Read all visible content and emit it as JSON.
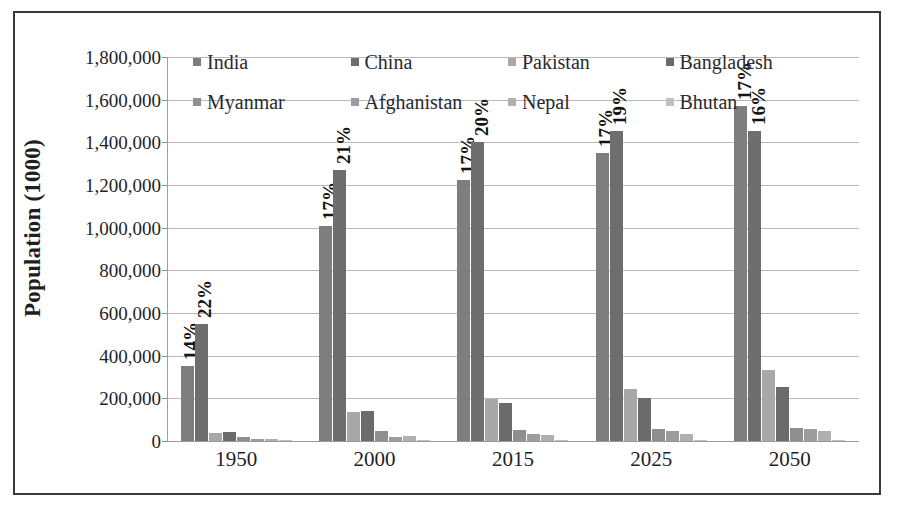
{
  "chart_data": {
    "type": "bar",
    "title": "",
    "xlabel": "",
    "ylabel": "Population (1000)",
    "ylim": [
      0,
      1800000
    ],
    "ytick_step": 200000,
    "grid": true,
    "legend_position": "top",
    "categories": [
      "1950",
      "2000",
      "2015",
      "2025",
      "2050"
    ],
    "ytick_labels": [
      "1,800,000",
      "1,600,000",
      "1,400,000",
      "1,200,000",
      "1,000,000",
      "800,000",
      "600,000",
      "400,000",
      "200,000",
      "0"
    ],
    "series": [
      {
        "name": "India",
        "color": "#7e7e7e",
        "values": [
          350000,
          1010000,
          1225000,
          1350000,
          1570000
        ],
        "labels": [
          "14%",
          "17%",
          "17%",
          "17%",
          "17%"
        ]
      },
      {
        "name": "China",
        "color": "#6e6e6e",
        "values": [
          550000,
          1270000,
          1400000,
          1455000,
          1455000
        ],
        "labels": [
          "22%",
          "21%",
          "20%",
          "19%",
          "16%"
        ]
      },
      {
        "name": "Pakistan",
        "color": "#a8a8a8",
        "values": [
          38000,
          138000,
          195000,
          245000,
          335000
        ],
        "labels": [
          "",
          "",
          "",
          "",
          ""
        ]
      },
      {
        "name": "Bangladesh",
        "color": "#6b6b6b",
        "values": [
          44000,
          140000,
          180000,
          200000,
          255000
        ],
        "labels": [
          "",
          "",
          "",
          "",
          ""
        ]
      },
      {
        "name": "Myanmar",
        "color": "#8f8f8f",
        "values": [
          18000,
          45000,
          52000,
          57000,
          60000
        ],
        "labels": [
          "",
          "",
          "",
          "",
          ""
        ]
      },
      {
        "name": "Afghanistan",
        "color": "#9c9c9c",
        "values": [
          8000,
          20000,
          33000,
          45000,
          58000
        ],
        "labels": [
          "",
          "",
          "",
          "",
          ""
        ]
      },
      {
        "name": "Nepal",
        "color": "#b0b0b0",
        "values": [
          8000,
          24000,
          30000,
          35000,
          45000
        ],
        "labels": [
          "",
          "",
          "",
          "",
          ""
        ]
      },
      {
        "name": "Bhutan",
        "color": "#c0c0c0",
        "values": [
          1500,
          2000,
          2500,
          3000,
          3500
        ],
        "labels": [
          "",
          "",
          "",
          "",
          ""
        ]
      }
    ]
  }
}
